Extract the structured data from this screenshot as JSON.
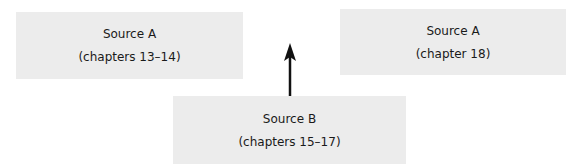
{
  "diagram": {
    "nodes": [
      {
        "id": "source-a-13-14",
        "title": "Source A",
        "subtitle": "(chapters 13–14)"
      },
      {
        "id": "source-a-18",
        "title": "Source A",
        "subtitle": "(chapter 18)"
      },
      {
        "id": "source-b-15-17",
        "title": "Source B",
        "subtitle": "(chapters 15–17)"
      }
    ],
    "edges": [
      {
        "from": "source-b-15-17",
        "to": "above",
        "type": "arrow-up"
      }
    ],
    "colors": {
      "box_fill": "#ececec",
      "text": "#1a1a1a",
      "arrow": "#111111",
      "background": "#ffffff"
    }
  }
}
